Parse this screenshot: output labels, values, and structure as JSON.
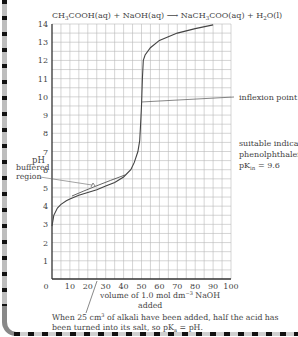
{
  "chart_data": {
    "type": "line",
    "xlabel": "volume of 1.0 mol dm⁻³ NaOH added",
    "ylabel": "pH",
    "xlim": [
      0,
      100
    ],
    "ylim": [
      0,
      14
    ],
    "x_ticks": [
      0,
      10,
      20,
      30,
      40,
      50,
      60,
      70,
      80,
      90,
      100
    ],
    "y_ticks": [
      1,
      2,
      3,
      4,
      5,
      6,
      7,
      8,
      9,
      10,
      11,
      12,
      13,
      14
    ],
    "grid": true,
    "grid_step_x": 5,
    "grid_step_y": 0.5,
    "series": [
      {
        "name": "titration curve",
        "x": [
          0,
          1,
          3,
          5,
          8,
          10,
          15,
          20,
          25,
          30,
          35,
          40,
          44,
          46,
          48,
          49,
          49.5,
          50,
          50.5,
          51,
          52,
          55,
          60,
          70,
          80,
          90
        ],
        "y": [
          2.9,
          3.5,
          3.9,
          4.1,
          4.3,
          4.4,
          4.6,
          4.75,
          4.9,
          5.1,
          5.3,
          5.6,
          6.0,
          6.4,
          7.0,
          7.6,
          8.5,
          9.5,
          11.0,
          12.0,
          12.3,
          12.7,
          13.1,
          13.5,
          13.75,
          13.95
        ]
      }
    ],
    "annotations": [
      {
        "text": "inflexion point",
        "x": 50,
        "y": 9.6
      },
      {
        "text": "buffered region",
        "x": 25,
        "y": 5.2
      },
      {
        "text": "suitable indicator: phenolphthalein pKin = 9.6"
      },
      {
        "text": "When 25 cm³ of alkali have been added, half the acid has been turned into its salt, so pKa = pH.",
        "x": 25,
        "y": 0
      }
    ]
  },
  "title": {
    "reactant": "CH",
    "sub1": "3",
    "reactant2": "COOH(aq) + NaOH(aq) ",
    "arrow": "⟶",
    "product": " NaCH",
    "sub2": "3",
    "product2": "COO(aq) + H",
    "sub3": "2",
    "product3": "O(l)"
  },
  "labels": {
    "ylabel": "pH",
    "inflexion": "inflexion point",
    "buffered1": "buffered",
    "buffered2": "region",
    "indicator1": "suitable indicator:",
    "indicator2": "phenolphthalein",
    "indicator3_a": "pK",
    "indicator3_sub": "in",
    "indicator3_b": " = 9.6",
    "xlabel1": "volume of 1.0 mol dm",
    "xlabel_sup": "−3",
    "xlabel1b": " NaOH",
    "xlabel2": "added",
    "note1a": "When 25 cm",
    "note1_sup": "3",
    "note1b": " of alkali have been added, half the acid has",
    "note2a": "been turned into its salt, so pK",
    "note2_sub": "a",
    "note2b": " = pH."
  },
  "ticks": {
    "x": [
      "0",
      "10",
      "20",
      "30",
      "40",
      "50",
      "60",
      "70",
      "80",
      "90",
      "100"
    ],
    "y": [
      "1",
      "2",
      "3",
      "4",
      "5",
      "6",
      "7",
      "8",
      "9",
      "10",
      "11",
      "12",
      "13",
      "14"
    ]
  }
}
